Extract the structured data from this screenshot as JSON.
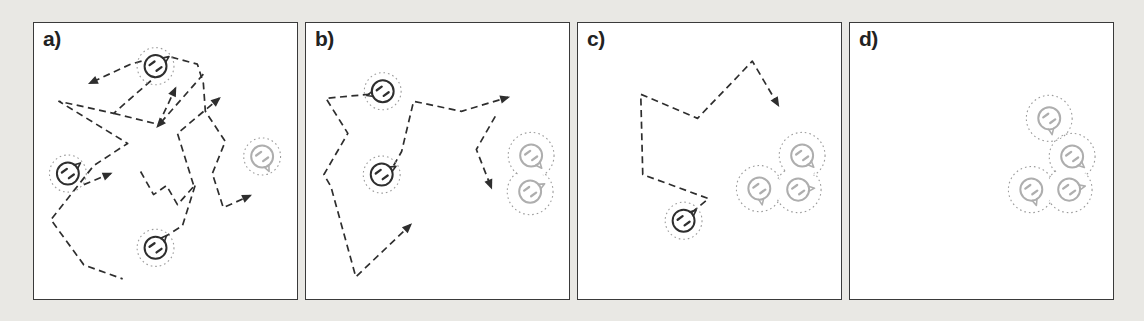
{
  "figure": {
    "colors": {
      "background": "#e9e8e4",
      "panel_bg": "#ffffff",
      "panel_border": "#3a3a3a",
      "ink": "#2e2e2e",
      "faded": "#aeaeae",
      "halo": "#9b9b9b"
    },
    "panels": [
      {
        "label": "a)",
        "particles": [
          {
            "x": 122,
            "y": 43,
            "shade": "dark",
            "tail": 35
          },
          {
            "x": 34,
            "y": 150,
            "shade": "dark",
            "tail": 40
          },
          {
            "x": 122,
            "y": 224,
            "shade": "dark",
            "tail": 48
          },
          {
            "x": 229,
            "y": 133,
            "shade": "light",
            "tail": -65
          }
        ],
        "clusters": [],
        "paths": [
          {
            "points": [
              [
                108,
                38
              ],
              [
                97,
                41
              ],
              [
                56,
                60
              ]
            ],
            "arrow": true
          },
          {
            "points": [
              [
                126,
                50
              ],
              [
                80,
                90
              ],
              [
                25,
                78
              ],
              [
                94,
                120
              ],
              [
                60,
                142
              ],
              [
                17,
                196
              ],
              [
                50,
                241
              ],
              [
                89,
                255
              ]
            ],
            "arrow": false
          },
          {
            "points": [
              [
                50,
                161
              ],
              [
                77,
                150
              ]
            ],
            "arrow": true
          },
          {
            "points": [
              [
                80,
                90
              ],
              [
                125,
                101
              ],
              [
                142,
                65
              ]
            ],
            "arrow": true
          },
          {
            "points": [
              [
                170,
                51
              ],
              [
                124,
                103
              ]
            ],
            "arrow": true
          },
          {
            "points": [
              [
                160,
                161
              ],
              [
                144,
                110
              ],
              [
                186,
                75
              ]
            ],
            "arrow": true
          },
          {
            "points": [
              [
                138,
                34
              ],
              [
                164,
                41
              ],
              [
                170,
                60
              ],
              [
                172,
                88
              ],
              [
                192,
                118
              ],
              [
                179,
                150
              ],
              [
                190,
                184
              ],
              [
                217,
                172
              ]
            ],
            "arrow": true
          },
          {
            "points": [
              [
                107,
                148
              ],
              [
                120,
                171
              ],
              [
                133,
                162
              ],
              [
                144,
                181
              ],
              [
                162,
                161
              ],
              [
                149,
                202
              ],
              [
                133,
                212
              ]
            ],
            "arrow": false
          }
        ]
      },
      {
        "label": "b)",
        "particles": [
          {
            "x": 77,
            "y": 68,
            "shade": "dark",
            "tail": 195
          },
          {
            "x": 76,
            "y": 151,
            "shade": "dark",
            "tail": 30
          }
        ],
        "clusters": [
          {
            "members": [
              {
                "x": 226,
                "y": 132,
                "tail": -50
              },
              {
                "x": 225,
                "y": 168,
                "tail": 28
              }
            ]
          }
        ],
        "paths": [
          {
            "points": [
              [
                64,
                71
              ],
              [
                20,
                75
              ],
              [
                42,
                110
              ],
              [
                18,
                151
              ],
              [
                25,
                163
              ],
              [
                50,
                253
              ],
              [
                105,
                201
              ]
            ],
            "arrow": true
          },
          {
            "points": [
              [
                88,
                142
              ],
              [
                96,
                128
              ],
              [
                108,
                78
              ],
              [
                156,
                88
              ],
              [
                203,
                74
              ]
            ],
            "arrow": true
          },
          {
            "points": [
              [
                190,
                93
              ],
              [
                171,
                126
              ],
              [
                186,
                164
              ]
            ],
            "arrow": true
          }
        ]
      },
      {
        "label": "c)",
        "particles": [
          {
            "x": 106,
            "y": 197,
            "shade": "dark",
            "tail": 40
          }
        ],
        "clusters": [
          {
            "members": [
              {
                "x": 225,
                "y": 132,
                "tail": -45
              },
              {
                "x": 182,
                "y": 165,
                "tail": -80
              },
              {
                "x": 221,
                "y": 166,
                "tail": 5
              }
            ]
          }
        ],
        "paths": [
          {
            "points": [
              [
                114,
                189
              ],
              [
                131,
                175
              ],
              [
                65,
                151
              ],
              [
                63,
                71
              ],
              [
                120,
                95
              ],
              [
                175,
                38
              ],
              [
                201,
                82
              ]
            ],
            "arrow": true
          }
        ]
      },
      {
        "label": "d)",
        "particles": [],
        "clusters": [
          {
            "members": [
              {
                "x": 200,
                "y": 95,
                "tail": -80
              },
              {
                "x": 223,
                "y": 133,
                "tail": -42
              },
              {
                "x": 220,
                "y": 166,
                "tail": 12
              },
              {
                "x": 182,
                "y": 166,
                "tail": -72
              }
            ]
          }
        ],
        "paths": []
      }
    ]
  }
}
